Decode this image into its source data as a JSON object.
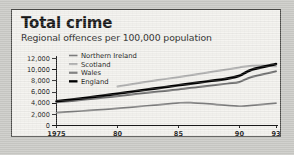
{
  "card": {
    "title": "Total crime",
    "subtitle": "Regional offences per 100,000 population"
  },
  "colors": {
    "background": "#c9c9c5",
    "card_background": "#f3f2ee",
    "border": "#4a4a47",
    "text": "#141414",
    "england": "#000000",
    "wales": "#6e6e6e",
    "scotland": "#aeaeae",
    "northern_ireland": "#7d7d7d"
  },
  "chart_data": {
    "type": "line",
    "title": "Total crime",
    "subtitle": "Regional offences per 100,000 population",
    "xlabel": "",
    "ylabel": "",
    "xlim": [
      1975,
      1993
    ],
    "ylim": [
      0,
      12000
    ],
    "grid": false,
    "legend_position": "top-left inside plot",
    "y_ticks": [
      0,
      2000,
      4000,
      6000,
      8000,
      10000,
      12000
    ],
    "y_tick_labels": [
      "0",
      "2,000",
      "4,000",
      "6,000",
      "8,000",
      "10,000",
      "12,000"
    ],
    "x_ticks": [
      1975,
      1980,
      1985,
      1990,
      1993
    ],
    "x_tick_labels": [
      "1975",
      "80",
      "85",
      "90",
      "93"
    ],
    "series": [
      {
        "name": "Northern Ireland",
        "color": "#7d7d7d",
        "width": 1.7,
        "x": [
          1975,
          1977,
          1979,
          1981,
          1983,
          1985,
          1986,
          1988,
          1990,
          1991,
          1993
        ],
        "values": [
          2300,
          2600,
          2900,
          3250,
          3650,
          4050,
          4100,
          3800,
          3450,
          3600,
          4000
        ]
      },
      {
        "name": "Scotland",
        "color": "#aeaeae",
        "width": 2.0,
        "x": [
          1980,
          1982,
          1984,
          1986,
          1988,
          1990,
          1991,
          1992,
          1993
        ],
        "values": [
          7000,
          7700,
          8350,
          9000,
          9700,
          10400,
          10700,
          10750,
          10600
        ]
      },
      {
        "name": "Wales",
        "color": "#6e6e6e",
        "width": 2.0,
        "x": [
          1975,
          1977,
          1979,
          1981,
          1983,
          1985,
          1987,
          1989,
          1990,
          1991,
          1993
        ],
        "values": [
          4150,
          4550,
          5000,
          5500,
          6000,
          6450,
          7000,
          7500,
          7800,
          8700,
          9700
        ]
      },
      {
        "name": "England",
        "color": "#000000",
        "width": 2.6,
        "x": [
          1975,
          1977,
          1979,
          1981,
          1983,
          1985,
          1987,
          1989,
          1990,
          1991,
          1993
        ],
        "values": [
          4350,
          4850,
          5400,
          6000,
          6600,
          7200,
          7800,
          8400,
          8900,
          10000,
          11000
        ]
      }
    ]
  }
}
